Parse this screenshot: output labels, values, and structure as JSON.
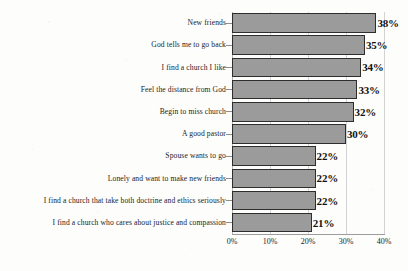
{
  "chart_data": {
    "type": "bar",
    "orientation": "horizontal",
    "title": "",
    "xlabel": "",
    "ylabel": "",
    "xlim": [
      0,
      40
    ],
    "grid": true,
    "legend": false,
    "tick_labels": [
      "0%",
      "10%",
      "20%",
      "30%",
      "40%"
    ],
    "tick_values": [
      0,
      10,
      20,
      30,
      40
    ],
    "bar_color": "#9b9b9b",
    "bar_edge_color": "#2e2e2e",
    "categories": [
      "New friends",
      "God tells me to go back",
      "I find a church I like",
      "Feel the distance from God",
      "Begin to miss church",
      "A good pastor",
      "Spouse wants to go",
      "Lonely and want to make new friends",
      "I find a church that take both doctrine and ethics seriously",
      "I find a church who cares about justice and compassion"
    ],
    "values": [
      38,
      35,
      34,
      33,
      32,
      30,
      22,
      22,
      22,
      21
    ],
    "value_labels": [
      "38%",
      "35%",
      "34%",
      "33%",
      "32%",
      "30%",
      "22%",
      "22%",
      "22%",
      "21%"
    ]
  }
}
